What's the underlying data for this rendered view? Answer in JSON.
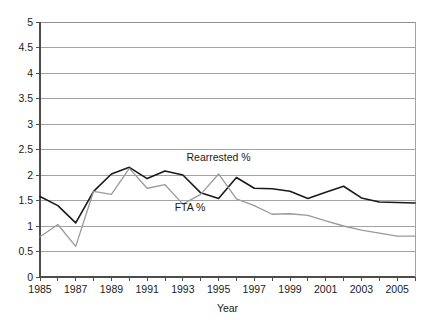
{
  "chart_data": {
    "type": "line",
    "title": "",
    "xlabel": "Year",
    "ylabel": "",
    "xlim": [
      1985,
      2006
    ],
    "ylim": [
      0,
      5
    ],
    "grid": true,
    "legend_position": "inline-annotation",
    "x": [
      1985,
      1986,
      1987,
      1988,
      1989,
      1990,
      1991,
      1992,
      1993,
      1994,
      1995,
      1996,
      1997,
      1998,
      1999,
      2000,
      2001,
      2002,
      2003,
      2004,
      2005,
      2006
    ],
    "xtick_labels": [
      "1985",
      "1987",
      "1989",
      "1991",
      "1993",
      "1995",
      "1997",
      "1999",
      "2001",
      "2003",
      "2005"
    ],
    "xtick_values": [
      1985,
      1987,
      1989,
      1991,
      1993,
      1995,
      1997,
      1999,
      2001,
      2003,
      2005
    ],
    "ytick_labels": [
      "0",
      "0.5",
      "1",
      "1.5",
      "2",
      "2.5",
      "3",
      "3.5",
      "4",
      "4.5",
      "5"
    ],
    "ytick_values": [
      0,
      0.5,
      1,
      1.5,
      2,
      2.5,
      3,
      3.5,
      4,
      4.5,
      5
    ],
    "series": [
      {
        "name": "Rearrested %",
        "color": "#1a1a1a",
        "stroke_width": 1.6,
        "annotation_label": "Rearrested %",
        "values": [
          1.58,
          1.4,
          1.06,
          1.68,
          2.02,
          2.15,
          1.93,
          2.08,
          2.0,
          1.65,
          1.54,
          1.95,
          1.74,
          1.73,
          1.68,
          1.54,
          1.66,
          1.78,
          1.55,
          1.47,
          1.46,
          1.45
        ]
      },
      {
        "name": "FTA %",
        "color": "#9a9a9a",
        "stroke_width": 1.3,
        "annotation_label": "FTA %",
        "values": [
          0.79,
          1.03,
          0.6,
          1.68,
          1.62,
          2.13,
          1.74,
          1.81,
          1.43,
          1.62,
          2.02,
          1.53,
          1.4,
          1.23,
          1.24,
          1.21,
          1.1,
          1.0,
          0.92,
          0.86,
          0.8,
          0.8
        ]
      }
    ],
    "annotations": [
      {
        "text": "Rearrested %",
        "x": 1995.0,
        "y": 2.28,
        "name": "rearrested-label"
      },
      {
        "text": "FTA %",
        "x": 1993.4,
        "y": 1.3,
        "name": "fta-label"
      }
    ]
  }
}
